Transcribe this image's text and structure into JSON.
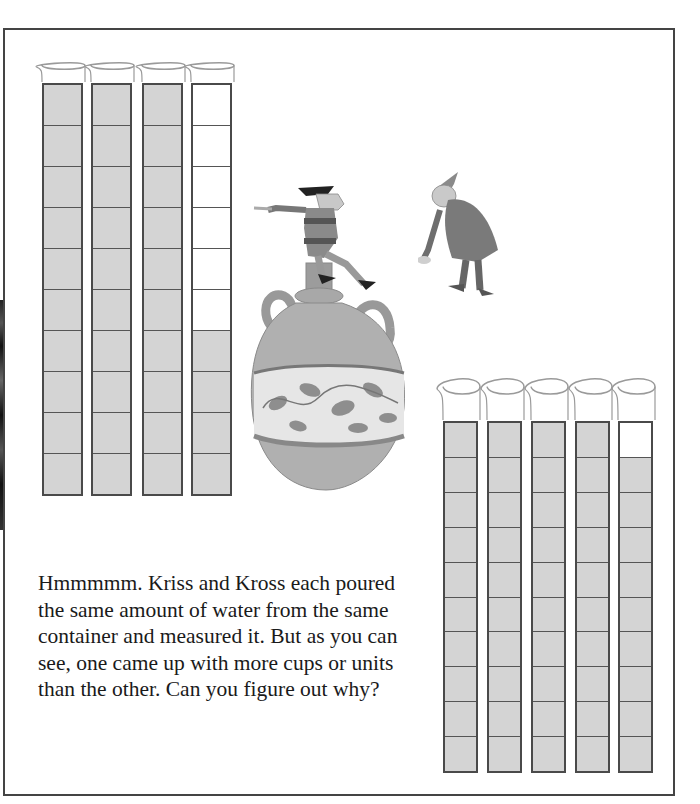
{
  "story": {
    "text": "Hmmmmm. Kriss and Kross each poured\nthe same amount of water from the same\ncontainer and measured it. But as you can\nsee, one came up with more cups or units\nthan the other. Can you figure out why?"
  },
  "characters": {
    "kriss": "pointing man sitting on vase",
    "kross": "bending old man with pointed hat"
  },
  "colors": {
    "fill": "#d4d4d4",
    "border": "#4a4a4a",
    "rim": "#9a9a9a"
  },
  "chart_data": {
    "type": "table",
    "series": [
      {
        "name": "Left set (larger units)",
        "segments_per_tube": 10,
        "tubes_filled": [
          10,
          10,
          10,
          4
        ],
        "total_units": 34
      },
      {
        "name": "Right set (smaller units)",
        "segments_per_tube": 10,
        "tubes_filled": [
          10,
          10,
          10,
          10,
          9
        ],
        "total_units": 49
      }
    ]
  }
}
